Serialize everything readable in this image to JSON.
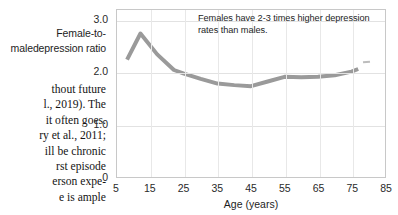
{
  "page": {
    "axis_caption_lines": [
      "Female-to-male",
      "depression ratio"
    ],
    "body_text_lines": [
      "thout future",
      "l., 2019). The",
      "it often goes.",
      "ry et al., 2011;",
      "ill be chronic",
      "rst episode",
      "erson expe-",
      "e is ample"
    ]
  },
  "chart_data": {
    "type": "line",
    "title": "",
    "annotation_lines": [
      "Females have 2-3 times higher depression",
      "rates than males."
    ],
    "xlabel": "Age (years)",
    "ylabel": "Female-to-male depression ratio",
    "xlim": [
      5,
      85
    ],
    "ylim": [
      0,
      3.2
    ],
    "xticks": [
      5,
      15,
      25,
      35,
      45,
      55,
      65,
      75,
      85
    ],
    "xtick_labels": [
      "5",
      "15",
      "25",
      "35",
      "45",
      "55",
      "65",
      "75",
      "85"
    ],
    "yticks": [
      0,
      1.0,
      2.0,
      3.0
    ],
    "ytick_labels": [
      "0",
      "1.0",
      "2.0",
      "3.0"
    ],
    "grid": true,
    "legend": "none",
    "line_color": "#9a9a9a",
    "line_width": 4,
    "x": [
      8,
      12,
      17,
      22,
      25,
      30,
      35,
      40,
      45,
      50,
      55,
      60,
      65,
      70,
      75,
      77
    ],
    "values": [
      2.25,
      2.75,
      2.35,
      2.05,
      1.98,
      1.88,
      1.79,
      1.76,
      1.74,
      1.83,
      1.92,
      1.91,
      1.92,
      1.95,
      2.02,
      2.07
    ]
  }
}
